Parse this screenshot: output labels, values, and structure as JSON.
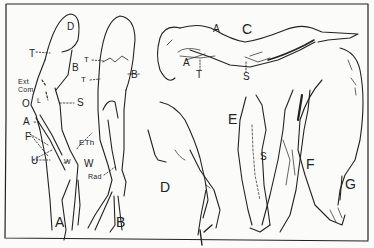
{
  "figure": {
    "panels": [
      "A",
      "B",
      "C",
      "D",
      "E",
      "F",
      "G"
    ],
    "labels": {
      "panel_a": {
        "letter": "A",
        "D": "D",
        "T": "T",
        "B": "B",
        "ext_com_1": "Ext",
        "ext_com_2": "Com",
        "L": "L",
        "O": "O",
        "S": "S",
        "A": "A",
        "F": "F",
        "ETh": "ETh",
        "U": "U",
        "W": "W"
      },
      "panel_b": {
        "letter": "B",
        "T1": "T",
        "T2": "T",
        "B": "B",
        "W": "W",
        "Rad": "Rad"
      },
      "panel_c": {
        "letter": "C",
        "A_top": "A",
        "A_low": "A",
        "T": "T",
        "S": "S"
      },
      "panel_d": {
        "letter": "D"
      },
      "panel_e": {
        "letter": "E",
        "S": "S"
      },
      "panel_f": {
        "letter": "F"
      },
      "panel_g": {
        "letter": "G"
      }
    }
  }
}
